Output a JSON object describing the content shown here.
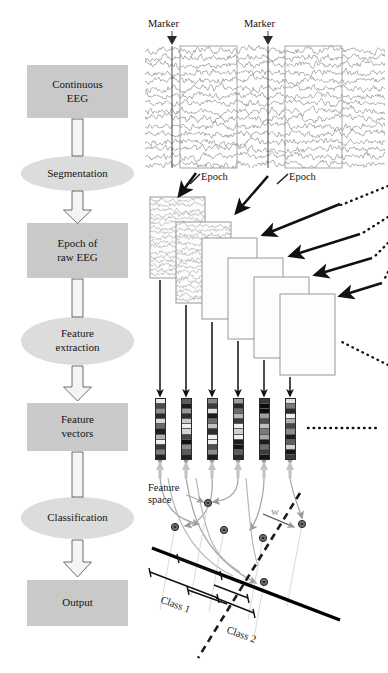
{
  "figure": {
    "type": "flow-diagram"
  },
  "pipeline": {
    "steps": [
      {
        "id": "continuous-eeg",
        "label": "Continuous\nEEG",
        "shape": "box"
      },
      {
        "id": "segmentation",
        "label": "Segmentation",
        "shape": "ellipse"
      },
      {
        "id": "epoch-raw-eeg",
        "label": "Epoch of\nraw EEG",
        "shape": "box"
      },
      {
        "id": "feature-extraction",
        "label": "Feature\nextraction",
        "shape": "ellipse"
      },
      {
        "id": "feature-vectors",
        "label": "Feature\nvectors",
        "shape": "box"
      },
      {
        "id": "classification",
        "label": "Classification",
        "shape": "ellipse"
      },
      {
        "id": "output",
        "label": "Output",
        "shape": "box"
      }
    ]
  },
  "annotations": {
    "marker_left": "Marker",
    "marker_right": "Marker",
    "epoch_left": "Epoch",
    "epoch_right": "Epoch",
    "feature_space": "Feature\nspace",
    "weight_vector": "w",
    "class_1": "Class 1",
    "class_2": "Class 2"
  },
  "chart_data": {
    "type": "line",
    "channels": 16,
    "marker_positions_px": [
      172,
      268
    ],
    "epoch_windows_px": [
      [
        180,
        237
      ],
      [
        285,
        342
      ]
    ],
    "xlabel": "",
    "ylabel": "",
    "grid": false
  },
  "epoch_stack": {
    "count": 6,
    "filled_with_eeg": 2
  },
  "feature_vectors": {
    "count": 6,
    "cells_per_vector": 12,
    "shades": [
      [
        "#e8e8e8",
        "#4a4a4a",
        "#8f8f8f",
        "#2a2a2a",
        "#d8d8d8",
        "#6a6a6a",
        "#1f1f1f",
        "#b4b4b4",
        "#efefef",
        "#3a3a3a",
        "#7c7c7c",
        "#222222"
      ],
      [
        "#5c5c5c",
        "#1c1c1c",
        "#9a9a9a",
        "#303030",
        "#c8c8c8",
        "#efefef",
        "#d4d4d4",
        "#454545",
        "#0f0f0f",
        "#8a8a8a",
        "#5a5a5a",
        "#202020"
      ],
      [
        "#8a8a8a",
        "#3c3c3c",
        "#dedede",
        "#1a1a1a",
        "#6f6f6f",
        "#c2c2c2",
        "#2e2e2e",
        "#efefef",
        "#efefef",
        "#4e4e4e",
        "#8c8c8c",
        "#1a1a1a"
      ],
      [
        "#9c9c9c",
        "#2a2a2a",
        "#6c6c6c",
        "#b8b8b8",
        "#3a3a3a",
        "#efefef",
        "#d0d0d0",
        "#efefef",
        "#1c1c1c",
        "#141414",
        "#5e5e5e",
        "#2a2a2a"
      ],
      [
        "#3a3a3a",
        "#0c0c0c",
        "#0c0c0c",
        "#9e9e9e",
        "#4e4e4e",
        "#c0c0c0",
        "#7a7a7a",
        "#a8a8a8",
        "#1c1c1c",
        "#6e6e6e",
        "#3c3c3c",
        "#141414"
      ],
      [
        "#e0e0e0",
        "#7a7a7a",
        "#2c2c2c",
        "#efefef",
        "#b0b0b0",
        "#474747",
        "#8c8c8c",
        "#1c1c1c",
        "#5e5e5e",
        "#d2d2d2",
        "#181818",
        "#3a3a3a"
      ]
    ]
  },
  "scatter": {
    "points": [
      {
        "x": 208,
        "y": 503,
        "cls": 1
      },
      {
        "x": 175,
        "y": 527,
        "cls": 1
      },
      {
        "x": 224,
        "y": 530,
        "cls": 1
      },
      {
        "x": 263,
        "y": 538,
        "cls": 2
      },
      {
        "x": 264,
        "y": 582,
        "cls": 2
      },
      {
        "x": 302,
        "y": 524,
        "cls": 2
      }
    ]
  },
  "colors": {
    "box_fill": "#c9c9c9",
    "ellipse_fill": "#dcdcdc",
    "outline": "#555555",
    "eeg_trace": "#6b6b6b",
    "arrow_black": "#111111",
    "arrow_gray": "#9a9a9a",
    "boundary_solid": "#000000",
    "boundary_dashed": "#1a1a1a"
  }
}
